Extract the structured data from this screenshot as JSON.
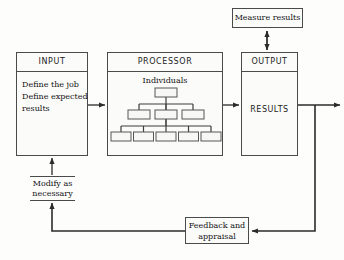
{
  "diagram": {
    "colors": {
      "background": "#fdfdfc",
      "stroke": "#4a4a4a",
      "text": "#121212",
      "node_fill": "#fbfbfa"
    },
    "nodes": {
      "input": {
        "header": "INPUT",
        "body_lines": [
          "Define the job",
          "Define expected",
          "results"
        ]
      },
      "processor": {
        "header": "PROCESSOR",
        "subtitle": "Individuals",
        "org_chart": {
          "level1_count": 1,
          "level2_count": 3,
          "level3_count": 5
        }
      },
      "output": {
        "header": "OUTPUT",
        "body_label": "RESULTS"
      },
      "measure": {
        "label": "Measure results"
      },
      "modify": {
        "line1": "Modify as",
        "line2": "necessary"
      },
      "feedback": {
        "line1": "Feedback and",
        "line2": "appraisal"
      }
    },
    "connectors": [
      {
        "name": "input-to-processor",
        "style": "single-arrow",
        "direction": "right"
      },
      {
        "name": "processor-to-output",
        "style": "single-arrow",
        "direction": "right"
      },
      {
        "name": "output-to-measure",
        "style": "double-arrow",
        "direction": "vertical"
      },
      {
        "name": "output-to-external",
        "style": "single-arrow",
        "direction": "right"
      },
      {
        "name": "output-to-feedback",
        "style": "single-arrow",
        "direction": "left"
      },
      {
        "name": "feedback-to-modify",
        "style": "single-arrow",
        "direction": "up"
      },
      {
        "name": "modify-to-input",
        "style": "single-arrow",
        "direction": "up"
      }
    ]
  }
}
